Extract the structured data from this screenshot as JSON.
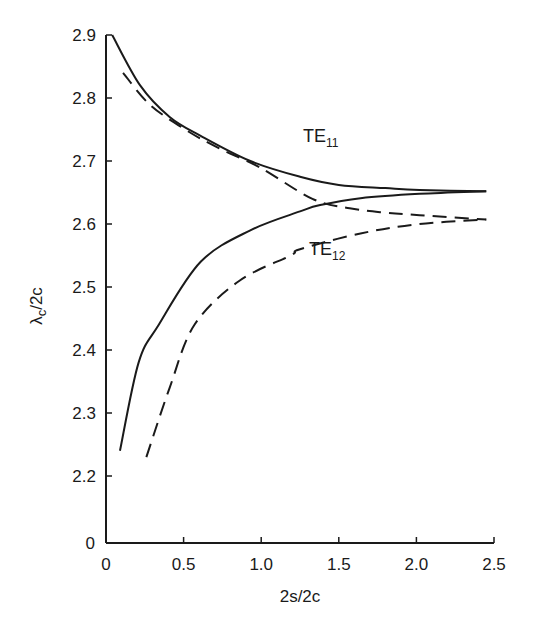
{
  "chart_data": {
    "type": "line",
    "title": "",
    "xlabel": "2s/2c",
    "ylabel": "λc/2c",
    "xlim": [
      0,
      2.5
    ],
    "ylim": [
      2.2,
      2.9
    ],
    "y_axis_break": true,
    "x_ticks": [
      "0",
      "0.5",
      "1.0",
      "1.5",
      "2.0",
      "2.5"
    ],
    "y_ticks": [
      "0",
      "2.2",
      "2.3",
      "2.4",
      "2.5",
      "2.6",
      "2.7",
      "2.8",
      "2.9"
    ],
    "grid": false,
    "legend": "none (inline curve labels)",
    "annotations": [
      {
        "text": "TE",
        "sub": "11",
        "x": 1.28,
        "y": 2.745
      },
      {
        "text": "TE",
        "sub": "12",
        "x": 1.32,
        "y": 2.56
      }
    ],
    "series": [
      {
        "name": "TE11 (solid)",
        "style": "solid",
        "x": [
          0.04,
          0.22,
          0.41,
          0.61,
          0.93,
          1.25,
          1.5,
          1.8,
          2.02,
          2.45
        ],
        "y": [
          2.9,
          2.82,
          2.77,
          2.74,
          2.7,
          2.675,
          2.662,
          2.657,
          2.654,
          2.652
        ]
      },
      {
        "name": "TE11 (dashed)",
        "style": "dashed",
        "x": [
          0.11,
          0.28,
          0.51,
          0.73,
          0.99,
          1.33,
          1.57,
          1.8,
          2.02,
          2.45
        ],
        "y": [
          2.84,
          2.79,
          2.75,
          2.72,
          2.69,
          2.64,
          2.625,
          2.618,
          2.614,
          2.607
        ]
      },
      {
        "name": "TE12 (solid)",
        "style": "solid",
        "x": [
          0.09,
          0.21,
          0.34,
          0.61,
          0.93,
          1.25,
          1.38,
          1.64,
          2.02,
          2.45
        ],
        "y": [
          2.24,
          2.38,
          2.44,
          2.54,
          2.59,
          2.62,
          2.63,
          2.641,
          2.648,
          2.652
        ]
      },
      {
        "name": "TE12 (dashed)",
        "style": "dashed",
        "x": [
          0.26,
          0.41,
          0.57,
          0.86,
          1.19,
          1.25,
          1.64,
          2.02,
          2.45
        ],
        "y": [
          2.23,
          2.34,
          2.44,
          2.51,
          2.55,
          2.56,
          2.585,
          2.6,
          2.607
        ]
      }
    ]
  },
  "labels": {
    "xlabel": "2s/2c",
    "ylabel_main": "λ",
    "ylabel_sub": "c",
    "ylabel_rest": "/2c",
    "te11_main": "TE",
    "te11_sub": "11",
    "te12_main": "TE",
    "te12_sub": "12"
  }
}
